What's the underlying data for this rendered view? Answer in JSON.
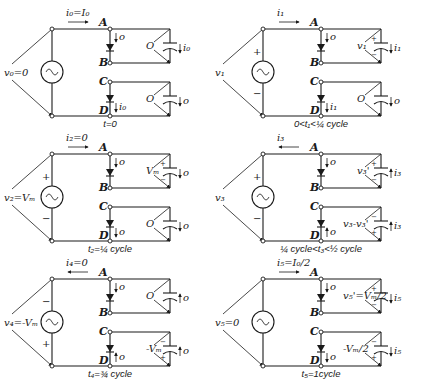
{
  "diagram": {
    "type": "circuit-states",
    "node_labels": [
      "A",
      "B",
      "C",
      "D"
    ],
    "panels": [
      {
        "id": "t0",
        "source_voltage": "v₀=0",
        "source_current": "i₀=I₀",
        "source_current_dir": "right",
        "source_polarity": "none",
        "diode_AB_current": "o",
        "diode_AB_dir": "down",
        "diode_CD_current": "i₀",
        "diode_CD_dir": "down",
        "cap_top_voltage": "O",
        "cap_top_polarity": "none",
        "cap_top_current": "i₀",
        "cap_top_current_dir": "down",
        "cap_bottom_voltage": "O",
        "cap_bottom_polarity": "none",
        "cap_bottom_current": "o",
        "cap_bottom_current_dir": "down",
        "time_caption": "t=0"
      },
      {
        "id": "t1",
        "source_voltage": "v₁",
        "source_current": "i₁",
        "source_current_dir": "right",
        "source_polarity": "plus-top",
        "diode_AB_current": "o",
        "diode_AB_dir": "down",
        "diode_CD_current": "i₁",
        "diode_CD_dir": "down",
        "cap_top_voltage": "v₁",
        "cap_top_polarity": "plus-top",
        "cap_top_current": "i₁",
        "cap_top_current_dir": "down",
        "cap_bottom_voltage": "O",
        "cap_bottom_polarity": "none",
        "cap_bottom_current": "o",
        "cap_bottom_current_dir": "down",
        "time_caption": "0<t₁<¼ cycle"
      },
      {
        "id": "t2",
        "source_voltage": "v₂=Vₘ",
        "source_current": "i₂=0",
        "source_current_dir": "right",
        "source_polarity": "plus-top",
        "diode_AB_current": "o",
        "diode_AB_dir": "down",
        "diode_CD_current": "o",
        "diode_CD_dir": "down",
        "cap_top_voltage": "Vₘ",
        "cap_top_polarity": "plus-top",
        "cap_top_current": "o",
        "cap_top_current_dir": "down",
        "cap_bottom_voltage": "O",
        "cap_bottom_polarity": "none",
        "cap_bottom_current": "o",
        "cap_bottom_current_dir": "down",
        "time_caption": "t₂=¼ cycle"
      },
      {
        "id": "t3",
        "source_voltage": "v₃",
        "source_current": "i₃",
        "source_current_dir": "left",
        "source_polarity": "plus-top",
        "diode_AB_current": "o",
        "diode_AB_dir": "down",
        "diode_CD_current": "o",
        "diode_CD_dir": "up",
        "cap_top_voltage": "v₃'",
        "cap_top_polarity": "plus-top",
        "cap_top_current": "i₃",
        "cap_top_current_dir": "up",
        "cap_bottom_voltage": "v₃-v₃'",
        "cap_bottom_polarity": "minus-top",
        "cap_bottom_current": "i₃",
        "cap_bottom_current_dir": "up",
        "time_caption": "¼ cycle<t₃<½ cycle"
      },
      {
        "id": "t4",
        "source_voltage": "v₄=-Vₘ",
        "source_current": "i₄=0",
        "source_current_dir": "left",
        "source_polarity": "minus-top",
        "diode_AB_current": "o",
        "diode_AB_dir": "down",
        "diode_CD_current": "o",
        "diode_CD_dir": "up",
        "cap_top_voltage": "O",
        "cap_top_polarity": "none",
        "cap_top_current": "o",
        "cap_top_current_dir": "up",
        "cap_bottom_voltage": "-Vₘ",
        "cap_bottom_polarity": "minus-top",
        "cap_bottom_current": "o",
        "cap_bottom_current_dir": "up",
        "time_caption": "t₄=¾ cycle"
      },
      {
        "id": "t5",
        "source_voltage": "v₅=0",
        "source_current": "i₅=I₀/2",
        "source_current_dir": "right",
        "source_polarity": "none",
        "diode_AB_current": "o",
        "diode_AB_dir": "down",
        "diode_CD_current": "o",
        "diode_CD_dir": "down",
        "cap_top_voltage": "v₅'=Vₘ/2",
        "cap_top_polarity": "plus-top",
        "cap_top_current": "i₅",
        "cap_top_current_dir": "down",
        "cap_bottom_voltage": "-Vₘ/2",
        "cap_bottom_polarity": "minus-top",
        "cap_bottom_current": "i₅",
        "cap_bottom_current_dir": "down",
        "time_caption": "t₅=1cycle"
      }
    ]
  }
}
